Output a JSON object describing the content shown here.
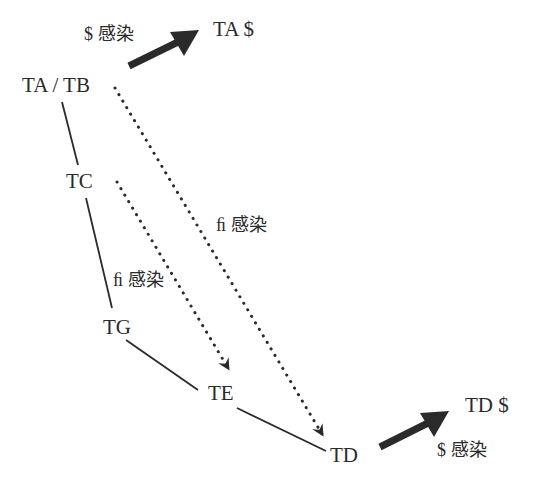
{
  "diagram": {
    "nodes": [
      {
        "id": "ta_tb",
        "label": "TA / TB"
      },
      {
        "id": "tc",
        "label": "TC"
      },
      {
        "id": "tg",
        "label": "TG"
      },
      {
        "id": "te",
        "label": "TE"
      },
      {
        "id": "td",
        "label": "TD"
      }
    ],
    "outputs": [
      {
        "id": "ta_out",
        "label": "TA $"
      },
      {
        "id": "td_out",
        "label": "TD $"
      }
    ],
    "edge_labels": {
      "top_arrow": "$ 感染",
      "bottom_arrow": "$ 感染",
      "long_dotted": "ﬁ 感染",
      "short_dotted": "ﬁ 感染"
    },
    "edges": [
      {
        "from": "ta_tb",
        "to": "tc",
        "style": "solid"
      },
      {
        "from": "tc",
        "to": "tg",
        "style": "solid"
      },
      {
        "from": "tg",
        "to": "te",
        "style": "solid"
      },
      {
        "from": "te",
        "to": "td",
        "style": "solid"
      },
      {
        "from": "ta_tb",
        "to": "td",
        "style": "dotted-arrow",
        "label": "ﬁ 感染"
      },
      {
        "from": "tc",
        "to": "te",
        "style": "dotted-arrow",
        "label": "ﬁ 感染"
      },
      {
        "from": "ta_tb",
        "to": "ta_out",
        "style": "bold-arrow",
        "label": "$ 感染"
      },
      {
        "from": "td",
        "to": "td_out",
        "style": "bold-arrow",
        "label": "$ 感染"
      }
    ],
    "colors": {
      "line": "#2a2a2a",
      "text": "#2a2a2a",
      "background": "#ffffff"
    }
  }
}
